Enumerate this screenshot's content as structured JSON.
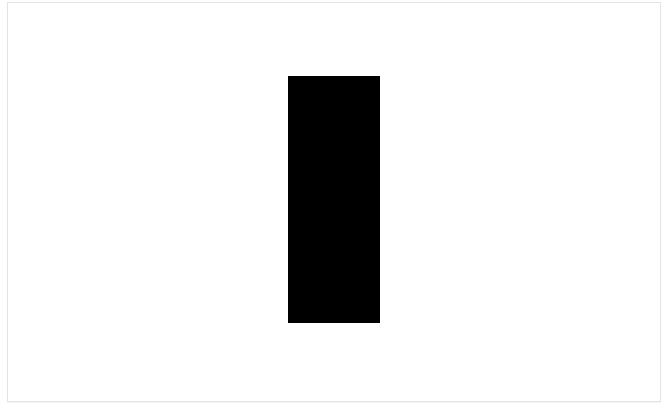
{
  "canvas": {
    "background": "#ffffff",
    "border_color": "#e4e4e4"
  },
  "shape": {
    "type": "rectangle",
    "fill": "#000000",
    "x": 288,
    "y": 76,
    "width": 92,
    "height": 247
  }
}
